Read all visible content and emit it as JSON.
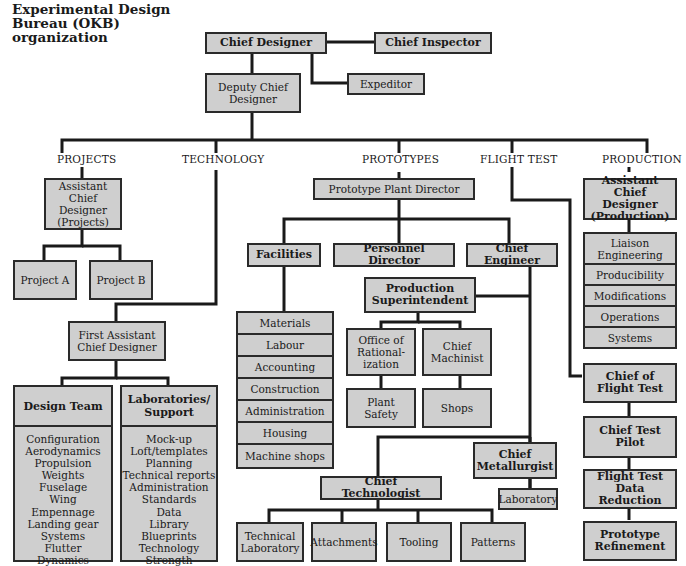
{
  "title": "Experimental Design Bureau (OKB) organization",
  "top": {
    "chief_designer": "Chief Designer",
    "chief_inspector": "Chief Inspector",
    "expeditor": "Expeditor",
    "deputy_chief_designer": "Deputy Chief Designer"
  },
  "categories": {
    "projects": "PROJECTS",
    "technology": "TECHNOLOGY",
    "prototypes": "PROTOTYPES",
    "flight_test": "FLIGHT TEST",
    "production": "PRODUCTION"
  },
  "projects": {
    "assistant": "Assistant Chief Designer (Projects)",
    "project_a": "Project A",
    "project_b": "Project B"
  },
  "technology": {
    "first_assistant": "First Assistant Chief Designer",
    "design_team": {
      "label": "Design Team",
      "items": [
        "Configuration",
        "Aerodynamics",
        "Propulsion",
        "Weights",
        "Fuselage",
        "Wing",
        "Empennage",
        "Landing gear",
        "Systems",
        "Flutter",
        "Dynamics"
      ]
    },
    "labs": {
      "label": "Laboratories/ Support",
      "items": [
        "Mock-up",
        "Loft/templates",
        "Planning",
        "Technical reports",
        "Administration",
        "Standards",
        "Data",
        "Library",
        "Blueprints",
        "Technology",
        "Strength"
      ]
    }
  },
  "prototypes": {
    "plant_director": "Prototype Plant Director",
    "facilities": "Facilities",
    "facilities_items": [
      "Materials",
      "Labour",
      "Accounting",
      "Construction",
      "Administration",
      "Housing",
      "Machine shops"
    ],
    "personnel_director": "Personnel Director",
    "chief_engineer": "Chief Engineer",
    "production_superintendent": "Production Superintendent",
    "office_rationalization": "Office of Rational- ization",
    "chief_machinist": "Chief Machinist",
    "plant_safety": "Plant Safety",
    "shops": "Shops",
    "chief_metallurgist": "Chief Metallurgist",
    "laboratory": "Laboratory",
    "chief_technologist": "Chief Technologist",
    "tech_items": [
      "Technical Laboratory",
      "Attachments",
      "Tooling",
      "Patterns"
    ]
  },
  "flight_test": {
    "chief_of_flight_test": "Chief of Flight Test",
    "chief_test_pilot": "Chief Test Pilot",
    "data_reduction": "Flight Test Data Reduction",
    "prototype_refinement": "Prototype Refinement"
  },
  "production": {
    "assistant": "Assistant Chief Designer (Production)",
    "items": [
      "Liaison Engineering",
      "Producibility",
      "Modifications",
      "Operations",
      "Systems"
    ]
  }
}
